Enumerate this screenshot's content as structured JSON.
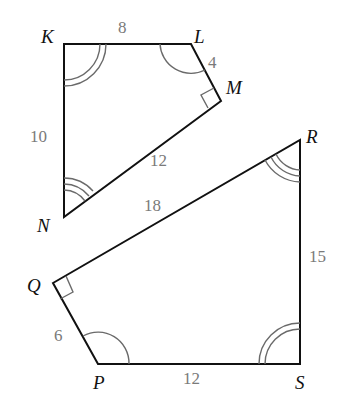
{
  "figure1": {
    "name": "KLMN",
    "vertices": {
      "K": {
        "label": "K",
        "x": 64,
        "y": 44
      },
      "L": {
        "label": "L",
        "x": 191,
        "y": 44
      },
      "M": {
        "label": "M",
        "x": 221,
        "y": 101
      },
      "N": {
        "label": "N",
        "x": 64,
        "y": 217
      }
    },
    "sides": {
      "KL": "8",
      "LM": "4",
      "MN": "12",
      "NK": "10"
    },
    "angle_marks": {
      "K": "double-arc",
      "L": "single-arc",
      "M": "right-angle",
      "N": "triple-arc"
    }
  },
  "figure2": {
    "name": "PQRS",
    "vertices": {
      "P": {
        "label": "P",
        "x": 98,
        "y": 364
      },
      "Q": {
        "label": "Q",
        "x": 53,
        "y": 283
      },
      "R": {
        "label": "R",
        "x": 300,
        "y": 140
      },
      "S": {
        "label": "S",
        "x": 300,
        "y": 364
      }
    },
    "sides": {
      "PQ": "6",
      "QR": "18",
      "RS": "15",
      "SP": "12"
    },
    "angle_marks": {
      "P": "single-arc",
      "Q": "right-angle",
      "R": "triple-arc",
      "S": "double-arc"
    }
  },
  "colors": {
    "edge": "#111111",
    "side_label": "#7a7a7a",
    "vertex_label": "#111111",
    "mark": "#6a6a6a"
  }
}
